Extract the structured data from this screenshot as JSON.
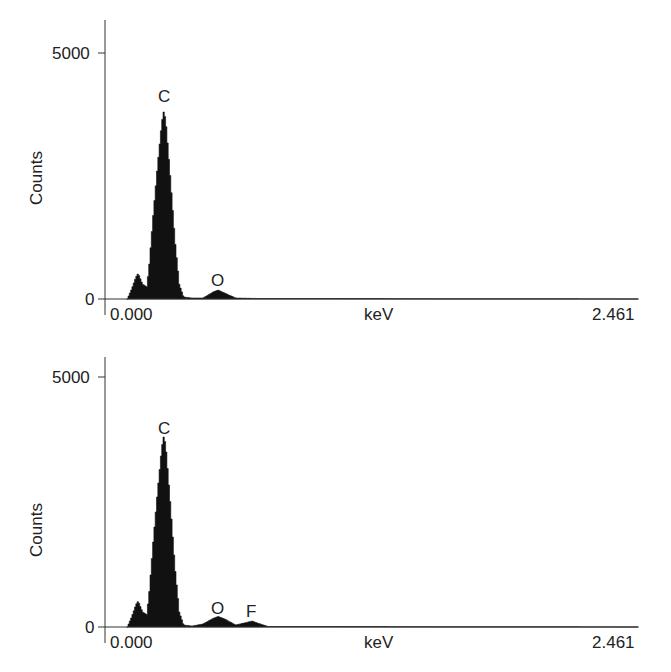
{
  "figure": {
    "panels": [
      {
        "id": "top",
        "ylabel": "Counts",
        "y_tick_top": "5000",
        "y_tick_bottom": "0",
        "x_tick_left": "0.000",
        "x_label": "keV",
        "x_tick_right": "2.461",
        "peak_labels": [
          "C",
          "O"
        ]
      },
      {
        "id": "bottom",
        "ylabel": "Counts",
        "y_tick_top": "5000",
        "y_tick_bottom": "0",
        "x_tick_left": "0.000",
        "x_label": "keV",
        "x_tick_right": "2.461",
        "peak_labels": [
          "C",
          "O",
          "F"
        ]
      }
    ]
  },
  "chart_data": [
    {
      "type": "area",
      "title": "",
      "xlabel": "keV",
      "ylabel": "Counts",
      "xlim": [
        0.0,
        2.461
      ],
      "ylim": [
        0,
        5000
      ],
      "grid": false,
      "legend": "none",
      "x": [
        0.1,
        0.12,
        0.14,
        0.15,
        0.17,
        0.19,
        0.2,
        0.22,
        0.24,
        0.26,
        0.27,
        0.28,
        0.3,
        0.32,
        0.34,
        0.36,
        0.4,
        0.45,
        0.5,
        0.52,
        0.55,
        0.6,
        0.7,
        1.0,
        1.5,
        2.0,
        2.461
      ],
      "values": [
        0,
        200,
        450,
        520,
        300,
        250,
        600,
        1700,
        2700,
        3600,
        3850,
        3500,
        2400,
        1200,
        300,
        40,
        20,
        20,
        150,
        180,
        120,
        20,
        10,
        10,
        5,
        5,
        0
      ],
      "annotations": [
        {
          "text": "C",
          "x": 0.277,
          "y": 3850
        },
        {
          "text": "O",
          "x": 0.525,
          "y": 180
        }
      ]
    },
    {
      "type": "area",
      "title": "",
      "xlabel": "keV",
      "ylabel": "Counts",
      "xlim": [
        0.0,
        2.461
      ],
      "ylim": [
        0,
        5000
      ],
      "grid": false,
      "legend": "none",
      "x": [
        0.1,
        0.12,
        0.14,
        0.15,
        0.17,
        0.19,
        0.2,
        0.22,
        0.24,
        0.26,
        0.27,
        0.28,
        0.3,
        0.32,
        0.34,
        0.36,
        0.4,
        0.45,
        0.5,
        0.52,
        0.55,
        0.6,
        0.65,
        0.677,
        0.7,
        0.75,
        1.0,
        1.5,
        2.0,
        2.461
      ],
      "values": [
        0,
        200,
        450,
        520,
        300,
        250,
        600,
        1700,
        2700,
        3600,
        3850,
        3500,
        2400,
        1200,
        300,
        40,
        20,
        60,
        180,
        210,
        160,
        40,
        90,
        120,
        80,
        10,
        10,
        5,
        5,
        0
      ],
      "annotations": [
        {
          "text": "C",
          "x": 0.277,
          "y": 3850
        },
        {
          "text": "O",
          "x": 0.525,
          "y": 210
        },
        {
          "text": "F",
          "x": 0.677,
          "y": 120
        }
      ]
    }
  ]
}
